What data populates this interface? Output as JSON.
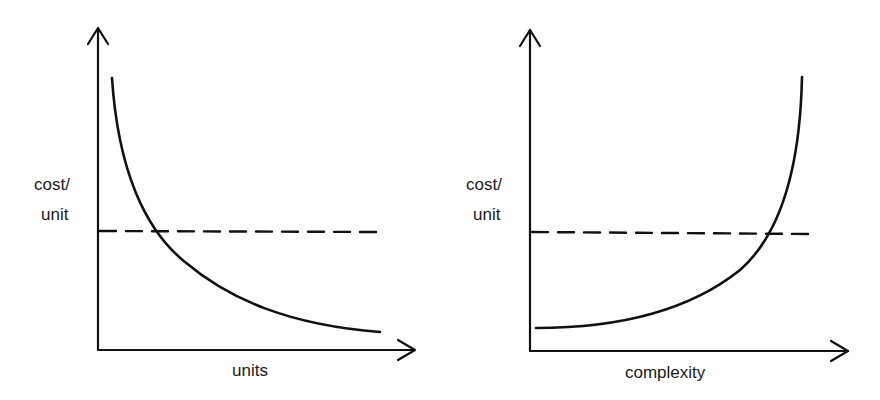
{
  "diagrams": [
    {
      "id": "left",
      "ylabel_line1": "cost/",
      "ylabel_line2": "unit",
      "xlabel": "units",
      "curve": "decreasing (hyperbolic)",
      "reference_line": "dashed horizontal"
    },
    {
      "id": "right",
      "ylabel_line1": "cost/",
      "ylabel_line2": "unit",
      "xlabel": "complexity",
      "curve": "increasing (exponential)",
      "reference_line": "dashed horizontal"
    }
  ],
  "colors": {
    "stroke": "#111111",
    "background": "#ffffff"
  }
}
